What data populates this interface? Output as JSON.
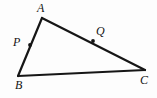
{
  "figure": {
    "type": "geometry-diagram",
    "shape": "triangle",
    "background_color": "#fdfdfd",
    "stroke_color": "#161616",
    "label_color": "#141414",
    "marker_color": "#141414",
    "stroke_width": 2.2,
    "marker_radius": 1.9,
    "canvas": {
      "width": 157,
      "height": 98
    },
    "vertices": [
      {
        "name": "A",
        "label": "A",
        "x": 42,
        "y": 18
      },
      {
        "name": "B",
        "label": "B",
        "x": 18,
        "y": 76
      },
      {
        "name": "C",
        "label": "C",
        "x": 145,
        "y": 70
      }
    ],
    "points": [
      {
        "name": "P",
        "label": "P",
        "x": 30,
        "y": 45,
        "on_segment": "AB"
      },
      {
        "name": "Q",
        "label": "Q",
        "x": 93,
        "y": 41,
        "on_segment": "AC"
      }
    ],
    "segments": [
      {
        "name": "AB",
        "from": "A",
        "to": "B"
      },
      {
        "name": "AC",
        "from": "A",
        "to": "C"
      },
      {
        "name": "BC",
        "from": "B",
        "to": "C"
      }
    ]
  }
}
